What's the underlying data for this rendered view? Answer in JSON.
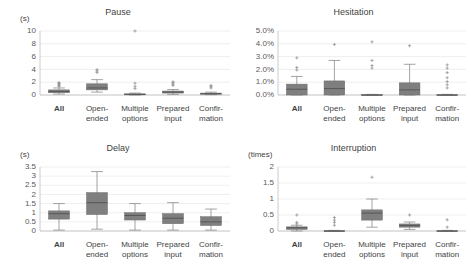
{
  "figure": {
    "panel_count": 4,
    "box_fill_color": "#7f7f7f",
    "gridline_color": "#e8e8e8",
    "axis_color": "#bfbfbf"
  },
  "categories": [
    "All",
    "Open-\nended",
    "Multiple\noptions",
    "Prepared\ninput",
    "Confir-\nmation"
  ],
  "chart_data": [
    {
      "type": "box",
      "title": "Pause",
      "ylabel": "(s)",
      "xlabel": "",
      "grid": true,
      "legend": "none",
      "ylim": [
        0,
        10
      ],
      "yticks": [
        0,
        2,
        4,
        6,
        8,
        10
      ],
      "ytick_labels": [
        "0",
        "2",
        "4",
        "6",
        "8",
        "10"
      ],
      "categories": [
        "All",
        "Open-ended",
        "Multiple options",
        "Prepared input",
        "Confirmation"
      ],
      "boxes": [
        {
          "category": "All",
          "min": 0.15,
          "q1": 0.35,
          "median": 0.55,
          "q3": 0.8,
          "max": 1.1,
          "outliers": [
            1.35,
            1.5,
            1.65,
            1.8,
            1.95
          ]
        },
        {
          "category": "Open-ended",
          "min": 0.45,
          "q1": 0.8,
          "median": 1.1,
          "q3": 1.75,
          "max": 2.4,
          "outliers": [
            3.5,
            3.75,
            3.95
          ]
        },
        {
          "category": "Multiple options",
          "min": 0.0,
          "q1": 0.05,
          "median": 0.1,
          "q3": 0.18,
          "max": 0.3,
          "outliers": [
            1.0,
            1.35,
            1.85
          ]
        },
        {
          "category": "Prepared input",
          "min": 0.1,
          "q1": 0.3,
          "median": 0.45,
          "q3": 0.62,
          "max": 0.85,
          "outliers": [
            1.5,
            1.7,
            1.9,
            2.05
          ]
        },
        {
          "category": "Confirmation",
          "min": 0.05,
          "q1": 0.12,
          "median": 0.2,
          "q3": 0.3,
          "max": 0.45,
          "outliers": [
            1.1,
            1.3,
            1.5
          ]
        }
      ],
      "far_outliers": [
        {
          "category": "Multiple options",
          "value": 10.0
        }
      ]
    },
    {
      "type": "box",
      "title": "Hesitation",
      "ylabel": "",
      "xlabel": "",
      "grid": true,
      "legend": "none",
      "ylim": [
        0,
        5
      ],
      "yticks": [
        0,
        1,
        2,
        3,
        4,
        5
      ],
      "ytick_labels": [
        "0.0%",
        "1.0%",
        "2.0%",
        "3.0%",
        "4.0%",
        "5.0%"
      ],
      "unit": "%",
      "categories": [
        "All",
        "Open-ended",
        "Multiple options",
        "Prepared input",
        "Confirmation"
      ],
      "boxes": [
        {
          "category": "All",
          "min": 0.0,
          "q1": 0.0,
          "median": 0.45,
          "q3": 0.85,
          "max": 1.45,
          "outliers": [
            1.95,
            2.15,
            2.9
          ]
        },
        {
          "category": "Open-ended",
          "min": 0.0,
          "q1": 0.0,
          "median": 0.5,
          "q3": 1.1,
          "max": 2.7,
          "outliers": [
            3.95
          ]
        },
        {
          "category": "Multiple options",
          "min": 0.0,
          "q1": 0.0,
          "median": 0.0,
          "q3": 0.03,
          "max": 0.05,
          "outliers": [
            2.1,
            2.3,
            2.7,
            4.15
          ]
        },
        {
          "category": "Prepared input",
          "min": 0.0,
          "q1": 0.0,
          "median": 0.4,
          "q3": 0.95,
          "max": 2.4,
          "outliers": [
            3.85
          ]
        },
        {
          "category": "Confirmation",
          "min": 0.0,
          "q1": 0.0,
          "median": 0.0,
          "q3": 0.03,
          "max": 0.05,
          "outliers": [
            0.55,
            0.8,
            1.05,
            1.35,
            1.75,
            2.1,
            2.35
          ]
        }
      ]
    },
    {
      "type": "box",
      "title": "Delay",
      "ylabel": "(s)",
      "xlabel": "",
      "grid": true,
      "legend": "none",
      "ylim": [
        0,
        3.5
      ],
      "yticks": [
        0,
        0.5,
        1,
        1.5,
        2,
        2.5,
        3,
        3.5
      ],
      "ytick_labels": [
        "0",
        "0.5",
        "1",
        "1.5",
        "2",
        "2.5",
        "3",
        "3.5"
      ],
      "categories": [
        "All",
        "Open-ended",
        "Multiple options",
        "Prepared input",
        "Confirmation"
      ],
      "boxes": [
        {
          "category": "All",
          "min": 0.05,
          "q1": 0.65,
          "median": 0.95,
          "q3": 1.1,
          "max": 1.5,
          "outliers": []
        },
        {
          "category": "Open-ended",
          "min": 0.1,
          "q1": 0.9,
          "median": 1.55,
          "q3": 2.1,
          "max": 3.25,
          "outliers": []
        },
        {
          "category": "Multiple options",
          "min": 0.05,
          "q1": 0.6,
          "median": 0.85,
          "q3": 1.0,
          "max": 1.5,
          "outliers": []
        },
        {
          "category": "Prepared input",
          "min": 0.05,
          "q1": 0.4,
          "median": 0.7,
          "q3": 0.95,
          "max": 1.55,
          "outliers": []
        },
        {
          "category": "Confirmation",
          "min": 0.05,
          "q1": 0.3,
          "median": 0.5,
          "q3": 0.78,
          "max": 1.2,
          "outliers": []
        }
      ]
    },
    {
      "type": "box",
      "title": "Interruption",
      "ylabel": "(times)",
      "xlabel": "",
      "grid": true,
      "legend": "none",
      "ylim": [
        0,
        2
      ],
      "yticks": [
        0,
        0.5,
        1,
        1.5,
        2
      ],
      "ytick_labels": [
        "0",
        "0.5",
        "1",
        "1.5",
        "2"
      ],
      "categories": [
        "All",
        "Open-ended",
        "Multiple options",
        "Prepared input",
        "Confirmation"
      ],
      "boxes": [
        {
          "category": "All",
          "min": 0.0,
          "q1": 0.05,
          "median": 0.1,
          "q3": 0.13,
          "max": 0.18,
          "outliers": [
            0.22,
            0.27,
            0.5
          ]
        },
        {
          "category": "Open-ended",
          "min": 0.0,
          "q1": 0.0,
          "median": 0.0,
          "q3": 0.01,
          "max": 0.02,
          "outliers": [
            0.18,
            0.27,
            0.34,
            0.42
          ]
        },
        {
          "category": "Multiple options",
          "min": 0.12,
          "q1": 0.34,
          "median": 0.56,
          "q3": 0.66,
          "max": 1.0,
          "outliers": [
            1.68
          ]
        },
        {
          "category": "Prepared input",
          "min": 0.05,
          "q1": 0.12,
          "median": 0.17,
          "q3": 0.22,
          "max": 0.28,
          "outliers": [
            0.5
          ]
        },
        {
          "category": "Confirmation",
          "min": 0.0,
          "q1": 0.0,
          "median": 0.0,
          "q3": 0.01,
          "max": 0.02,
          "outliers": [
            0.12,
            0.35
          ]
        }
      ]
    }
  ]
}
